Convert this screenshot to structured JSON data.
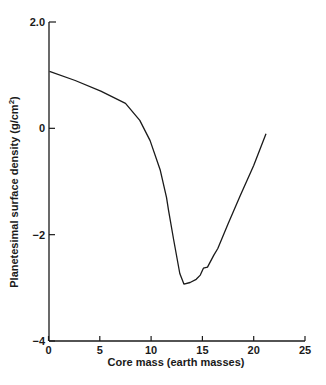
{
  "chart_data": {
    "type": "line",
    "title": "",
    "xlabel": "Core mass (earth masses)",
    "ylabel": "Planetesimal surface density (g/cm",
    "ylabel_superscript": "2",
    "ylabel_suffix": ")",
    "xlim": [
      0,
      25
    ],
    "ylim": [
      -4,
      2.0
    ],
    "x_ticks": [
      0,
      5,
      10,
      15,
      20,
      25
    ],
    "x_tick_labels": [
      "0",
      "5",
      "10",
      "15",
      "20",
      "25"
    ],
    "y_ticks": [
      2.0,
      0,
      -2,
      -4
    ],
    "y_tick_labels": [
      "2.0",
      "0",
      "−2",
      "−4"
    ],
    "grid": false,
    "legend": null,
    "series": [
      {
        "name": "surface density",
        "x": [
          0.1,
          2.6,
          5.1,
          7.5,
          8.9,
          9.9,
          10.9,
          11.5,
          11.7,
          12.2,
          12.8,
          13.2,
          13.8,
          14.4,
          14.8,
          15.1,
          15.5,
          16.1,
          16.5,
          17.5,
          18.7,
          20.0,
          21.2
        ],
        "y": [
          1.07,
          0.9,
          0.7,
          0.47,
          0.15,
          -0.23,
          -0.79,
          -1.3,
          -1.54,
          -2.1,
          -2.73,
          -2.93,
          -2.9,
          -2.84,
          -2.76,
          -2.63,
          -2.61,
          -2.39,
          -2.26,
          -1.8,
          -1.26,
          -0.7,
          -0.1
        ]
      }
    ]
  }
}
